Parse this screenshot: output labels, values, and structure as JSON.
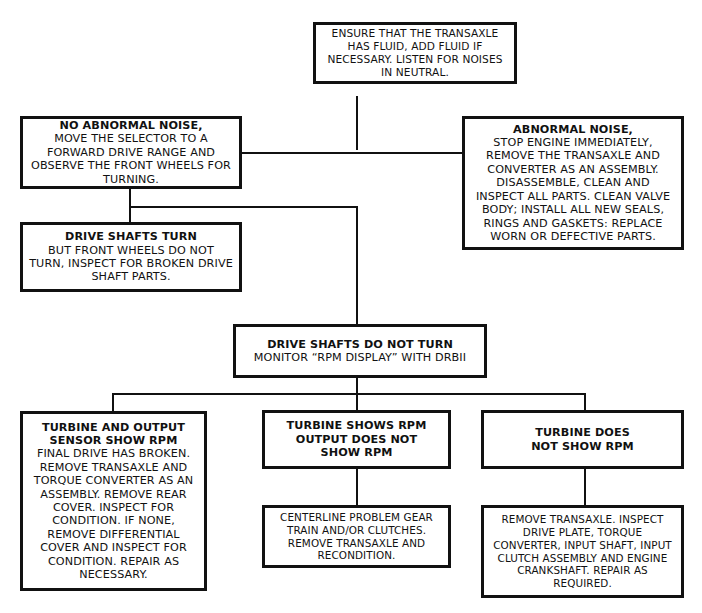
{
  "diagram": {
    "nodes": {
      "start": {
        "title": "",
        "body": "ENSURE THAT THE TRANSAXLE HAS FLUID, ADD FLUID IF NECESSARY. LISTEN FOR NOISES IN NEUTRAL."
      },
      "no_abnormal_noise": {
        "title": "NO ABNORMAL NOISE,",
        "body": "MOVE THE SELECTOR TO A FORWARD DRIVE RANGE AND OBSERVE THE FRONT WHEELS FOR TURNING."
      },
      "abnormal_noise": {
        "title": "ABNORMAL NOISE,",
        "body": "STOP ENGINE IMMEDIATELY, REMOVE THE TRANSAXLE AND CONVERTER AS AN ASSEMBLY. DISASSEMBLE, CLEAN AND INSPECT ALL PARTS. CLEAN VALVE BODY; INSTALL ALL NEW SEALS, RINGS AND GASKETS: REPLACE WORN OR DEFECTIVE PARTS."
      },
      "drive_shafts_turn": {
        "title": "DRIVE SHAFTS TURN",
        "body": "BUT FRONT WHEELS DO NOT TURN, INSPECT FOR BROKEN DRIVE SHAFT PARTS."
      },
      "drive_shafts_do_not_turn": {
        "title": "DRIVE SHAFTS DO NOT TURN",
        "body": "MONITOR “RPM DISPLAY” WITH DRBII"
      },
      "turbine_and_output": {
        "title": "TURBINE AND OUTPUT SENSOR SHOW RPM",
        "body": "FINAL DRIVE HAS BROKEN. REMOVE TRANSAXLE AND TORQUE CONVERTER AS AN ASSEMBLY. REMOVE REAR COVER. INSPECT FOR CONDITION. IF NONE, REMOVE DIFFERENTIAL COVER AND INSPECT FOR CONDITION. REPAIR AS NECESSARY."
      },
      "turbine_shows_rpm": {
        "title": "TURBINE SHOWS RPM OUTPUT DOES NOT SHOW RPM",
        "body": ""
      },
      "centerline_problem": {
        "title": "",
        "body": "CENTERLINE PROBLEM GEAR TRAIN AND/OR CLUTCHES. REMOVE TRANSAXLE AND RECONDITION."
      },
      "turbine_does_not_show": {
        "title": "TURBINE DOES NOT SHOW RPM",
        "body": ""
      },
      "remove_transaxle": {
        "title": "",
        "body": "REMOVE TRANSAXLE. INSPECT DRIVE PLATE, TORQUE CONVERTER, INPUT SHAFT, INPUT CLUTCH ASSEMBLY AND ENGINE CRANKSHAFT. REPAIR AS REQUIRED."
      }
    },
    "edges": [
      [
        "start",
        "no_abnormal_noise"
      ],
      [
        "start",
        "abnormal_noise"
      ],
      [
        "no_abnormal_noise",
        "drive_shafts_turn"
      ],
      [
        "no_abnormal_noise",
        "drive_shafts_do_not_turn"
      ],
      [
        "drive_shafts_do_not_turn",
        "turbine_and_output"
      ],
      [
        "drive_shafts_do_not_turn",
        "turbine_shows_rpm"
      ],
      [
        "drive_shafts_do_not_turn",
        "turbine_does_not_show"
      ],
      [
        "turbine_shows_rpm",
        "centerline_problem"
      ],
      [
        "turbine_does_not_show",
        "remove_transaxle"
      ]
    ]
  }
}
